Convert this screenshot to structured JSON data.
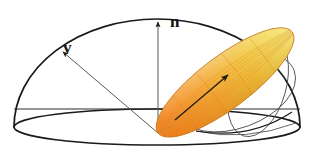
{
  "figure": {
    "background_color": "#ffffff",
    "width": 314,
    "height": 162
  },
  "labels": {
    "normal": "n",
    "view": "v"
  },
  "colors": {
    "outline": "#1a1a1a",
    "thin_guide": "#4a4a52",
    "axis_line": "#5a5a5a",
    "lobe_light": "#f4de63",
    "lobe_mid": "#f3a93a",
    "lobe_dark": "#f08322",
    "lobe_edge": "#c8781d",
    "mesh_line": "#d98a2a",
    "label_color": "#111111",
    "arrow_color": "#1a1a1a"
  },
  "geometry": {
    "origin": {
      "x": 158,
      "y": 133
    },
    "base_ellipse": {
      "cx": 157,
      "cy": 127,
      "rx": 143,
      "ry": 18
    },
    "dome": {
      "cx": 157,
      "cy": 127,
      "rx": 143,
      "ry": 108
    },
    "normal_vector": {
      "from_x": 158,
      "from_y": 133,
      "to_x": 158,
      "to_y": 21
    },
    "view_vector": {
      "from_x": 158,
      "from_y": 133,
      "to_x": 61,
      "to_y": 51
    },
    "lobe_axis": {
      "from_x": 158,
      "from_y": 133,
      "to_x": 287,
      "to_y": 36
    },
    "lobe_arrow": {
      "from_x": 184,
      "from_y": 113,
      "to_x": 231,
      "to_y": 72
    },
    "lobe_half_width": 26
  },
  "label_positions": {
    "normal": {
      "x": 170,
      "y": 26
    },
    "view": {
      "x": 63,
      "y": 52
    }
  },
  "elements": {
    "hemisphere_name": "hemisphere-dome",
    "base_name": "hemisphere-base-ellipse",
    "lobe_name": "specular-lobe"
  }
}
